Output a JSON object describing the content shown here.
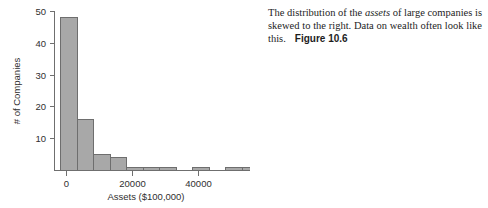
{
  "chart_data": {
    "type": "bar",
    "title": "",
    "xlabel": "Assets ($100,000)",
    "ylabel": "# of Companies",
    "xlim": [
      -1800,
      57000
    ],
    "ylim": [
      0,
      50
    ],
    "xticks": [
      "0",
      "20000",
      "40000"
    ],
    "xtick_values": [
      0,
      20000,
      40000
    ],
    "yticks": [
      "10",
      "20",
      "30",
      "40",
      "50"
    ],
    "ytick_values": [
      10,
      20,
      30,
      40,
      50
    ],
    "grid": false,
    "legend": "none",
    "bin_width": 5000,
    "bin_starts": [
      -1700,
      3300,
      8300,
      13300,
      18300,
      23300,
      28300,
      38300,
      48300,
      53300
    ],
    "categories": [
      "-1700",
      "3300",
      "8300",
      "13300",
      "18300",
      "23300",
      "28300",
      "38300",
      "48300",
      "53300"
    ],
    "values": [
      48,
      16,
      5,
      4,
      1,
      1,
      1,
      1,
      1,
      1
    ],
    "bar_fill_color": "#a8a8a8",
    "bar_edge_color": "#6e6e6e"
  },
  "caption": {
    "line_prefix": "The distribution of the ",
    "italic_word": "assets",
    "line_suffix": " of large companies is skewed to the right. Data on wealth often look like this.",
    "figure_label": "Figure 10.6"
  }
}
